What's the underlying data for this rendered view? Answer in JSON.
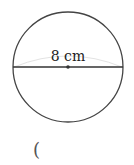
{
  "diagram": {
    "shape": "circle",
    "diameter_label": "8 cm",
    "center": {
      "x": 68,
      "y": 67
    },
    "radius": 55,
    "colors": {
      "stroke": "#444444",
      "arc_hint": "#e0e0e0",
      "text": "#222222"
    }
  },
  "answer": {
    "open_paren": "("
  }
}
